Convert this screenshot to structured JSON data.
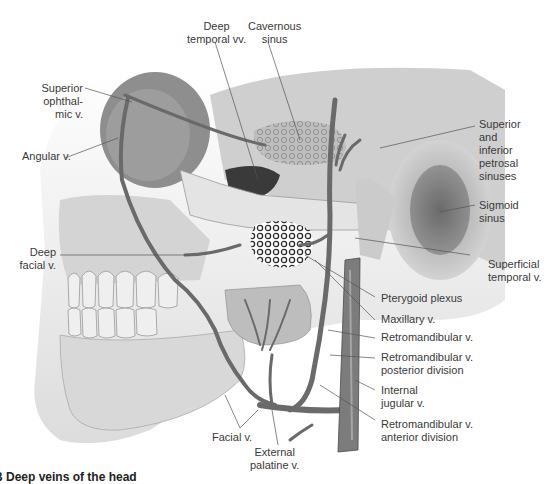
{
  "figure": {
    "caption_visible": "… Dee... veins of the head (cut off)"
  },
  "labels": {
    "deep_temporal": "Deep\ntemporal vv.",
    "cavernous_sinus": "Cavernous\nsinus",
    "superior_ophthalmic": "Superior\nophthal-\nmic v.",
    "angular": "Angular v.",
    "petrosal_sinuses": "Superior\nand\ninferior\npetrosal\nsinuses",
    "sigmoid_sinus": "Sigmoid\nsinus",
    "superficial_temporal": "Superficial\ntemporal v.",
    "deep_facial": "Deep\nfacial v.",
    "pterygoid_plexus": "Pterygoid plexus",
    "maxillary": "Maxillary v.",
    "retromandibular": "Retromandibular v.",
    "retromandibular_posterior": "Retromandibular v.\nposterior division",
    "internal_jugular": "Internal\njugular v.",
    "retromandibular_anterior": "Retromandibular v.\nanterior division",
    "facial": "Facial v.",
    "external_palatine": "External\npalatine v."
  },
  "caption": "B Deep veins of the head",
  "colors": {
    "bone": "#d9d9d9",
    "bone_shadow": "#a8a8a8",
    "vein": "#6f6f6f",
    "vein_dark": "#4a4a4a",
    "leader": "#555555",
    "text": "#3a3a3a"
  }
}
